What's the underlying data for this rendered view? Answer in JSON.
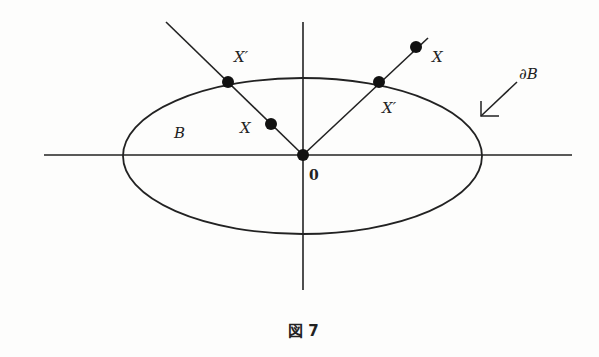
{
  "figure": {
    "caption": "図 7",
    "labels": {
      "region": "B",
      "boundary": "∂B",
      "origin": "0",
      "left_inner_point": "X",
      "left_boundary_point": "X′",
      "right_outer_point": "X",
      "right_boundary_point": "X′"
    },
    "colors": {
      "stroke": "#222222",
      "background": "#fdfdfc"
    }
  }
}
